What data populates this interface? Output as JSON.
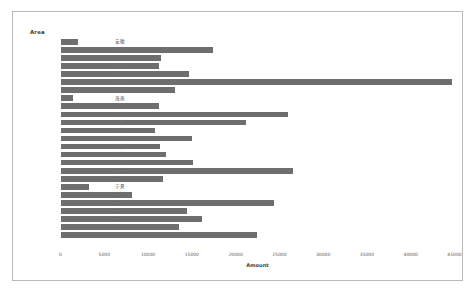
{
  "chart_data": {
    "type": "bar",
    "orientation": "horizontal",
    "title": "",
    "xlabel": "Amount",
    "ylabel": "Area",
    "xlim": [
      0,
      45000
    ],
    "xticks": [
      0,
      5000,
      10000,
      15000,
      20000,
      25000,
      30000,
      35000,
      40000,
      45000
    ],
    "xtick_labels": [
      "0",
      "5000",
      "10000",
      "15000",
      "20000",
      "25000",
      "30000",
      "35000",
      "40000",
      "45000"
    ],
    "grid": false,
    "legend": false,
    "bar_color": "#6e6e6e",
    "categories": [
      "安徽",
      "北京",
      "福建",
      "甘肃",
      "广东",
      "广西",
      "贵州",
      "海南",
      "河北",
      "河南",
      "黑龙江",
      "湖北",
      "湖南",
      "吉林",
      "江苏",
      "江西",
      "辽宁",
      "内蒙古",
      "宁夏",
      "青海",
      "山东",
      "山西",
      "陝西",
      "上海",
      "四川"
    ],
    "values": [
      2050,
      17450,
      11500,
      11200,
      14700,
      44700,
      13100,
      1450,
      11200,
      26000,
      21200,
      10800,
      15000,
      11400,
      12000,
      15100,
      26500,
      11700,
      3300,
      8200,
      24400,
      14400,
      16200,
      13500,
      22400
    ],
    "series": [
      {
        "name": "Amount",
        "values": [
          2050,
          17450,
          11500,
          11200,
          14700,
          44700,
          13100,
          1450,
          11200,
          26000,
          21200,
          10800,
          15000,
          11400,
          12000,
          15100,
          26500,
          11700,
          3300,
          8200,
          24400,
          14400,
          16200,
          13500,
          22400
        ]
      }
    ]
  }
}
